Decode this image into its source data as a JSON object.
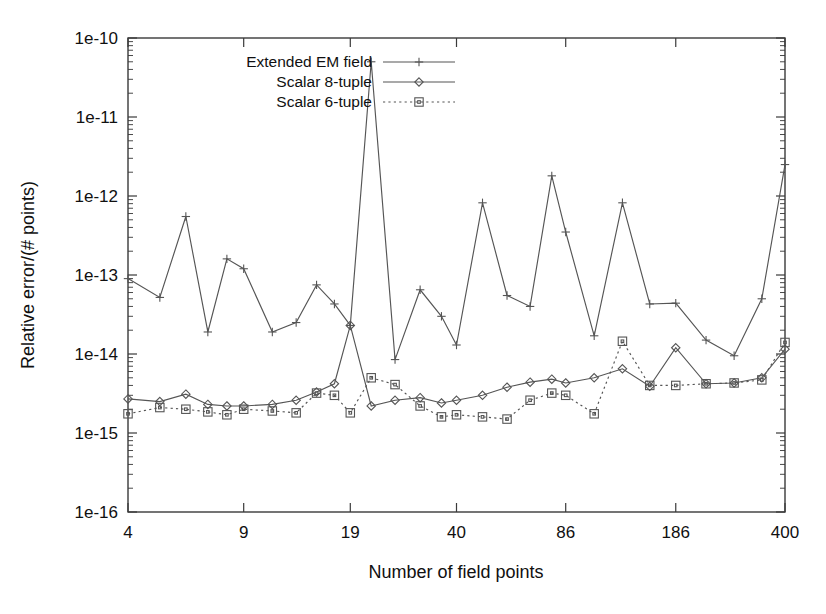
{
  "figure": {
    "background": "#ffffff",
    "line_color": "#555555",
    "axis_color": "#3a3a3a",
    "text_color": "#101010"
  },
  "chart_data": {
    "type": "line",
    "title": "",
    "subtitle": "",
    "xlabel": "Number of field points",
    "ylabel": "Relative error/(# points)",
    "xscale": "log",
    "yscale": "log",
    "grid": false,
    "legend_position": "upper-left-inside",
    "xlim": [
      4,
      400
    ],
    "ylim": [
      1e-16,
      1e-10
    ],
    "xticks": [
      4,
      9,
      19,
      40,
      86,
      186,
      400
    ],
    "xtick_labels": [
      "4",
      "9",
      "19",
      "40",
      "86",
      "186",
      "400"
    ],
    "yticks": [
      1e-16,
      1e-15,
      1e-14,
      1e-13,
      1e-12,
      1e-11,
      1e-10
    ],
    "ytick_labels": [
      "1e-16",
      "1e-15",
      "1e-14",
      "1e-13",
      "1e-12",
      "1e-11",
      "1e-10"
    ],
    "x": [
      4,
      5,
      6,
      7,
      8,
      9,
      11,
      13,
      15,
      17,
      19,
      22,
      26,
      31,
      36,
      40,
      48,
      57,
      67,
      78,
      86,
      105,
      128,
      155,
      186,
      230,
      280,
      340,
      400
    ],
    "series": [
      {
        "name": "Extended EM field",
        "marker": "plus",
        "linestyle": "solid",
        "values": [
          9e-14,
          5.2e-14,
          5.5e-13,
          1.9e-14,
          1.6e-13,
          1.2e-13,
          1.9e-14,
          2.5e-14,
          7.5e-14,
          4.3e-14,
          2.3e-14,
          5e-11,
          8.5e-15,
          6.5e-14,
          3e-14,
          1.3e-14,
          8.2e-13,
          5.5e-14,
          4e-14,
          1.8e-12,
          3.5e-13,
          1.7e-14,
          8.2e-13,
          4.3e-14,
          4.4e-14,
          1.5e-14,
          9.5e-15,
          5e-14,
          2.5e-12
        ]
      },
      {
        "name": "Scalar 8-tuple",
        "marker": "diamond",
        "linestyle": "solid",
        "values": [
          2.7e-15,
          2.5e-15,
          3.1e-15,
          2.3e-15,
          2.2e-15,
          2.2e-15,
          2.3e-15,
          2.6e-15,
          3.3e-15,
          4.2e-15,
          2.3e-14,
          2.2e-15,
          2.6e-15,
          2.8e-15,
          2.4e-15,
          2.6e-15,
          3e-15,
          3.8e-15,
          4.4e-15,
          4.8e-15,
          4.3e-15,
          5e-15,
          6.5e-15,
          3.9e-15,
          1.2e-14,
          4.2e-15,
          4.3e-15,
          5e-15,
          1.15e-14
        ]
      },
      {
        "name": "Scalar 6-tuple",
        "marker": "square",
        "linestyle": "dotted",
        "values": [
          1.75e-15,
          2.1e-15,
          2e-15,
          1.85e-15,
          1.7e-15,
          2e-15,
          1.9e-15,
          1.8e-15,
          3.2e-15,
          3e-15,
          1.8e-15,
          5e-15,
          4.1e-15,
          2.2e-15,
          1.6e-15,
          1.7e-15,
          1.6e-15,
          1.5e-15,
          2.6e-15,
          3.2e-15,
          3e-15,
          1.75e-15,
          1.45e-14,
          4e-15,
          4e-15,
          4.2e-15,
          4.3e-15,
          4.7e-15,
          1.4e-14
        ]
      }
    ],
    "annotations": []
  },
  "legend": {
    "entries": [
      {
        "label": "Extended EM field",
        "marker": "plus",
        "linestyle": "solid"
      },
      {
        "label": "Scalar 8-tuple",
        "marker": "diamond",
        "linestyle": "solid"
      },
      {
        "label": "Scalar 6-tuple",
        "marker": "square",
        "linestyle": "dotted"
      }
    ]
  }
}
